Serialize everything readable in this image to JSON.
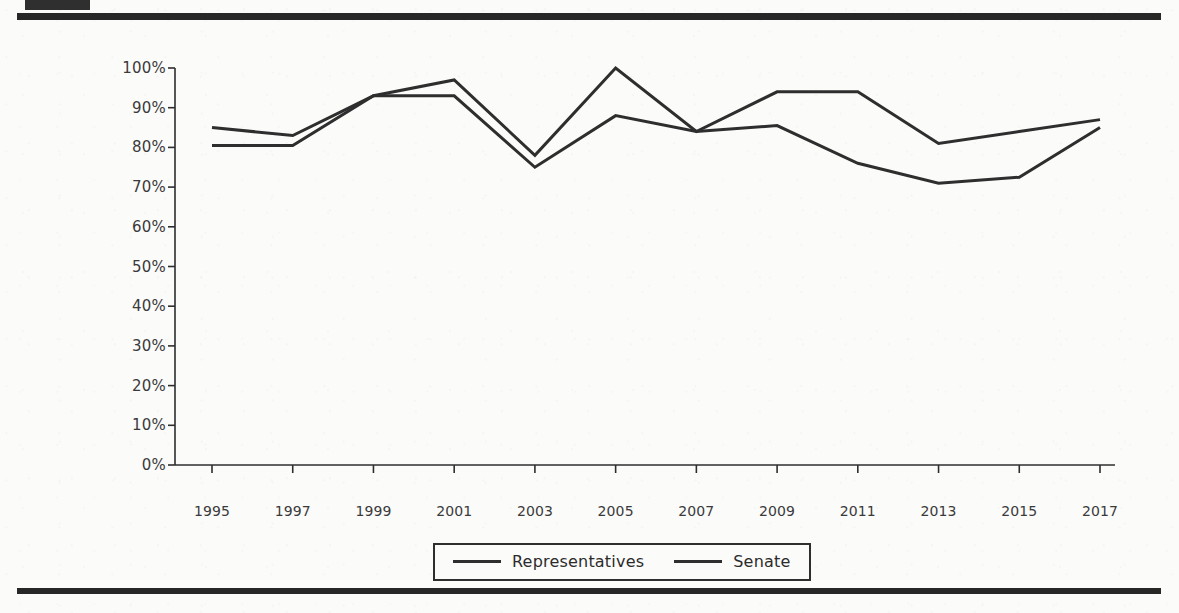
{
  "page": {
    "background_color": "#fbfbfa",
    "rule_color": "#272727",
    "ink_color": "#2e2e2e"
  },
  "chart_data": {
    "type": "line",
    "title": "",
    "subtitle": "",
    "xlabel": "",
    "ylabel": "",
    "x": [
      1995,
      1997,
      1999,
      2001,
      2003,
      2005,
      2007,
      2009,
      2011,
      2013,
      2015,
      2017
    ],
    "categories": [
      "1995",
      "1997",
      "1999",
      "2001",
      "2003",
      "2005",
      "2007",
      "2009",
      "2011",
      "2013",
      "2015",
      "2017"
    ],
    "series": [
      {
        "name": "Representatives",
        "color": "#2e2e2e",
        "values": [
          85,
          83,
          93,
          93,
          75,
          88,
          84,
          85.5,
          76,
          71,
          72.5,
          85
        ]
      },
      {
        "name": "Senate",
        "color": "#2e2e2e",
        "values": [
          80.5,
          80.5,
          93,
          97,
          78,
          100,
          84,
          94,
          94,
          81,
          84,
          87
        ]
      }
    ],
    "ylim": [
      0,
      100
    ],
    "ytick_values": [
      0,
      10,
      20,
      30,
      40,
      50,
      60,
      70,
      80,
      90,
      100
    ],
    "ytick_labels": [
      "0%",
      "10%",
      "20%",
      "30%",
      "40%",
      "50%",
      "60%",
      "70%",
      "80%",
      "90%",
      "100%"
    ],
    "xtick_labels": [
      "1995",
      "1997",
      "1999",
      "2001",
      "2003",
      "2005",
      "2007",
      "2009",
      "2011",
      "2013",
      "2015",
      "2017"
    ],
    "grid": false,
    "legend_position": "bottom-center",
    "legend_entries": [
      "Representatives",
      "Senate"
    ]
  },
  "legend": {
    "items": [
      {
        "label": "Representatives"
      },
      {
        "label": "Senate"
      }
    ]
  }
}
